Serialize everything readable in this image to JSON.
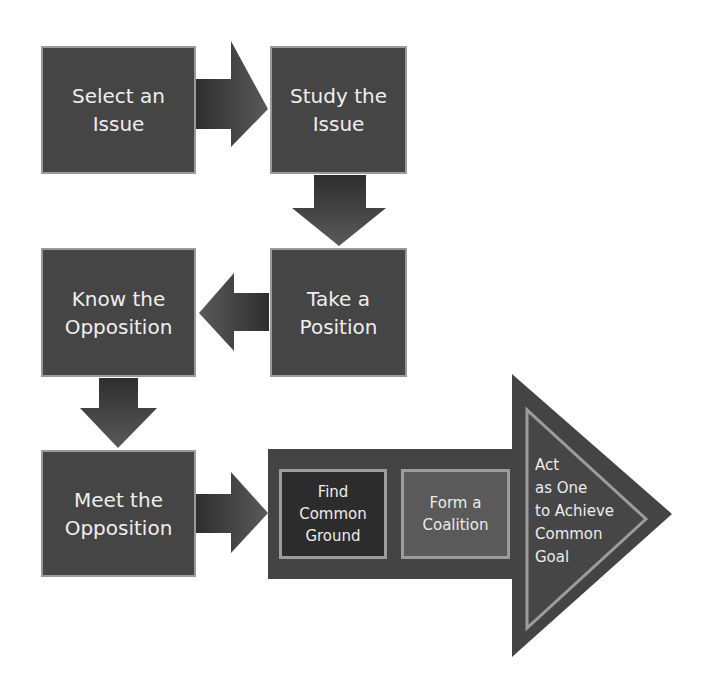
{
  "diagram": {
    "type": "process-flow",
    "colors": {
      "box_fill": "#454545",
      "box_border": "#9a9a9a",
      "arrow_fill": "#4a4a4a",
      "big_arrow_fill": "#444444",
      "find_common_ground_fill": "#2c2c2c",
      "form_coalition_fill": "#5a5a5a",
      "inner_border": "#9c9c9c",
      "text": "#efefef",
      "background": "#ffffff"
    },
    "steps": [
      {
        "id": "step-1",
        "label": "Select an\nIssue"
      },
      {
        "id": "step-2",
        "label": "Study the\nIssue"
      },
      {
        "id": "step-3",
        "label": "Take a\nPosition"
      },
      {
        "id": "step-4",
        "label": "Know the\nOpposition"
      },
      {
        "id": "step-5",
        "label": "Meet the\nOpposition"
      }
    ],
    "final_arrow": {
      "sub_steps": [
        {
          "id": "sub-1",
          "label": "Find\nCommon\nGround"
        },
        {
          "id": "sub-2",
          "label": "Form a\nCoalition"
        }
      ],
      "goal": {
        "label": "Act\nas One\nto Achieve\nCommon\nGoal"
      }
    },
    "connectors": [
      {
        "from": "step-1",
        "to": "step-2",
        "direction": "right"
      },
      {
        "from": "step-2",
        "to": "step-3",
        "direction": "down"
      },
      {
        "from": "step-3",
        "to": "step-4",
        "direction": "left"
      },
      {
        "from": "step-4",
        "to": "step-5",
        "direction": "down"
      },
      {
        "from": "step-5",
        "to": "final_arrow",
        "direction": "right"
      }
    ]
  }
}
